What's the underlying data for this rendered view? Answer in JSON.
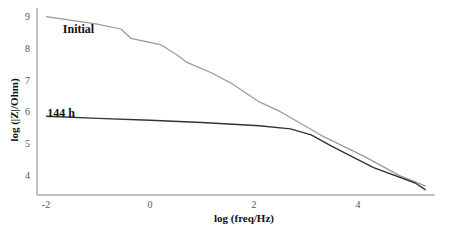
{
  "chart_data": {
    "type": "line",
    "title": "",
    "xlabel": "log (freq/Hz)",
    "ylabel": "log (|Z|/Ohm)",
    "xlim": [
      -2.2,
      5.5
    ],
    "ylim": [
      3.4,
      9.1
    ],
    "xticks": [
      -2,
      0,
      2,
      4
    ],
    "yticks": [
      4,
      5,
      6,
      7,
      8,
      9
    ],
    "grid": false,
    "legend_position": "inline",
    "series": [
      {
        "name": "Initial",
        "color": "#9a9a9a",
        "x": [
          -2,
          -1.04,
          -0.56,
          -0.37,
          0.2,
          0.5,
          0.7,
          1.2,
          1.6,
          2.1,
          2.5,
          3.3,
          4.1,
          4.8,
          5.3
        ],
        "y": [
          8.98,
          8.75,
          8.59,
          8.3,
          8.1,
          7.8,
          7.55,
          7.2,
          6.85,
          6.3,
          6.0,
          5.24,
          4.6,
          3.98,
          3.65
        ]
      },
      {
        "name": "144 h",
        "color": "#333333",
        "x": [
          -2,
          -1.0,
          0,
          1.0,
          2.1,
          2.7,
          3.1,
          3.5,
          4.3,
          5.1,
          5.3
        ],
        "y": [
          5.85,
          5.78,
          5.72,
          5.65,
          5.55,
          5.45,
          5.26,
          4.9,
          4.23,
          3.75,
          3.53
        ]
      }
    ],
    "annotations": [
      {
        "text": "Initial",
        "x": -1.1,
        "y": 8.6
      },
      {
        "text": "144 h",
        "x": -1.4,
        "y": 5.95
      }
    ]
  }
}
